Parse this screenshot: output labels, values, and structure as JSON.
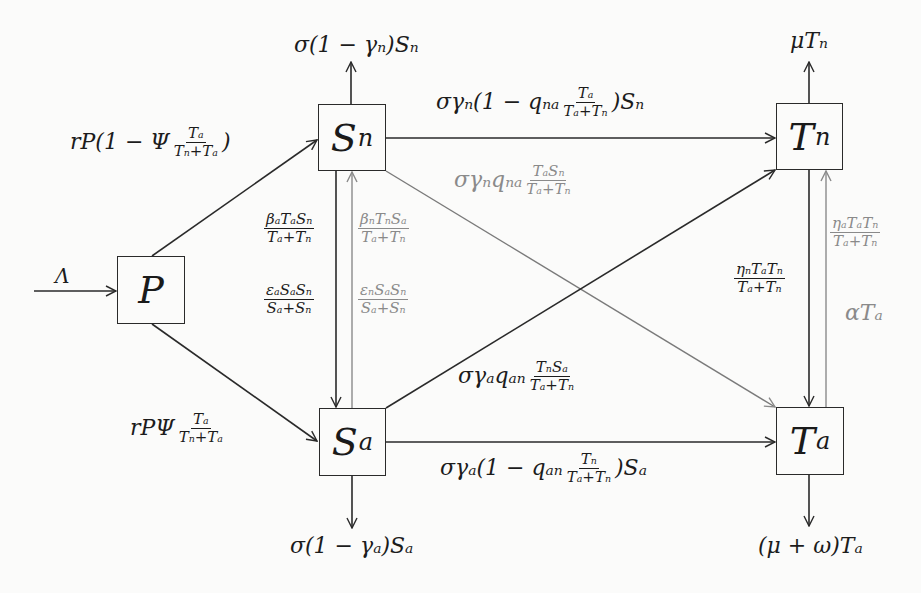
{
  "diagram": {
    "type": "compartment-flow",
    "nodes": [
      {
        "id": "P",
        "main": "P",
        "sub": ""
      },
      {
        "id": "Sn",
        "main": "S",
        "sub": "n"
      },
      {
        "id": "Sa",
        "main": "S",
        "sub": "a"
      },
      {
        "id": "Tn",
        "main": "T",
        "sub": "n"
      },
      {
        "id": "Ta",
        "main": "T",
        "sub": "a"
      }
    ],
    "edges": {
      "inflow_P": {
        "from": "",
        "to": "P",
        "label": "Λ"
      },
      "P_to_Sn": {
        "from": "P",
        "to": "Sn",
        "prefix": "rP(1 − Ψ",
        "num": "Tₐ",
        "den": "Tₙ+Tₐ",
        "suffix": ")"
      },
      "P_to_Sa": {
        "from": "P",
        "to": "Sa",
        "prefix": "rPΨ",
        "num": "Tₐ",
        "den": "Tₙ+Tₐ",
        "suffix": ""
      },
      "Sn_out": {
        "from": "Sn",
        "to": "",
        "label": "σ(1 − γₙ)Sₙ"
      },
      "Sa_out": {
        "from": "Sa",
        "to": "",
        "label": "σ(1 − γₐ)Sₐ"
      },
      "Tn_out": {
        "from": "Tn",
        "to": "",
        "label": "μTₙ"
      },
      "Ta_out": {
        "from": "Ta",
        "to": "",
        "label": "(μ + ω)Tₐ"
      },
      "Sn_to_Tn": {
        "from": "Sn",
        "to": "Tn",
        "prefix": "σγₙ(1 − qₙₐ",
        "num": "Tₐ",
        "den": "Tₐ+Tₙ",
        "suffix": ")Sₙ"
      },
      "Sa_to_Ta": {
        "from": "Sa",
        "to": "Ta",
        "prefix": "σγₐ(1 − qₐₙ",
        "num": "Tₙ",
        "den": "Tₐ+Tₙ",
        "suffix": ")Sₐ"
      },
      "Sn_to_Ta": {
        "from": "Sn",
        "to": "Ta",
        "prefix": "σγₙqₙₐ",
        "num": "TₐSₙ",
        "den": "Tₐ+Tₙ",
        "color": "gray"
      },
      "Sa_to_Tn": {
        "from": "Sa",
        "to": "Tn",
        "prefix": "σγₐqₐₙ",
        "num": "TₙSₐ",
        "den": "Tₐ+Tₙ",
        "color": "black"
      },
      "Sn_to_Sa_beta": {
        "from": "Sn",
        "to": "Sa",
        "num": "βₐTₐSₙ",
        "den": "Tₐ+Tₙ",
        "color": "black"
      },
      "Sn_to_Sa_eps": {
        "from": "Sn",
        "to": "Sa",
        "num": "εₐSₐSₙ",
        "den": "Sₐ+Sₙ",
        "color": "black"
      },
      "Sa_to_Sn_beta": {
        "from": "Sa",
        "to": "Sn",
        "num": "βₙTₙSₐ",
        "den": "Tₐ+Tₙ",
        "color": "gray"
      },
      "Sa_to_Sn_eps": {
        "from": "Sa",
        "to": "Sn",
        "num": "εₙSₐSₙ",
        "den": "Sₐ+Sₙ",
        "color": "gray"
      },
      "Tn_to_Ta_eta": {
        "from": "Tn",
        "to": "Ta",
        "num": "ηₙTₐTₙ",
        "den": "Tₐ+Tₙ",
        "color": "black"
      },
      "Ta_to_Tn_eta": {
        "from": "Ta",
        "to": "Tn",
        "num": "ηₐTₐTₙ",
        "den": "Tₐ+Tₙ",
        "color": "gray"
      },
      "Ta_to_Tn_alpha": {
        "from": "Ta",
        "to": "Tn",
        "label": "αTₐ",
        "color": "gray"
      }
    },
    "colors": {
      "primary_line": "#2a2a2a",
      "secondary_line": "#8a8a8a",
      "background": "#fbfbfa"
    }
  }
}
